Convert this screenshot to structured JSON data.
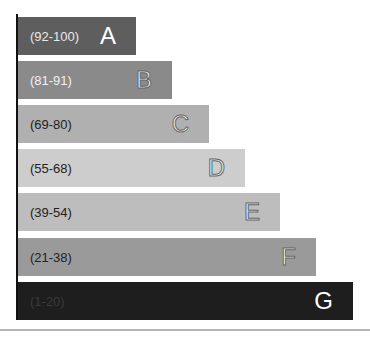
{
  "chart_data": {
    "type": "bar",
    "orientation": "horizontal",
    "title": "",
    "xlabel": "",
    "ylabel": "",
    "grid": false,
    "legend": null,
    "categories": [
      "A",
      "B",
      "C",
      "D",
      "E",
      "F",
      "G"
    ],
    "ranges": [
      "(92-100)",
      "(81-91)",
      "(69-80)",
      "(55-68)",
      "(39-54)",
      "(21-38)",
      "(1-20)"
    ],
    "values": [
      1,
      2,
      3,
      4,
      5,
      6,
      7
    ],
    "bars": [
      {
        "letter": "A",
        "range": "(92-100)",
        "top": 17,
        "width": 118,
        "color": "#5e5e5e",
        "range_color": "#e8e8e8",
        "letter_style": "solid"
      },
      {
        "letter": "B",
        "range": "(81-91)",
        "top": 61,
        "width": 154,
        "color": "#8a8a8a",
        "range_color": "#f0f0f0",
        "letter_style": "outline"
      },
      {
        "letter": "C",
        "range": "(69-80)",
        "top": 105,
        "width": 191,
        "color": "#b0b0b0",
        "range_color": "#222222",
        "letter_style": "outline"
      },
      {
        "letter": "D",
        "range": "(55-68)",
        "top": 149,
        "width": 227,
        "color": "#cdcdcd",
        "range_color": "#222222",
        "letter_style": "outline"
      },
      {
        "letter": "E",
        "range": "(39-54)",
        "top": 193,
        "width": 262,
        "color": "#bdbdbd",
        "range_color": "#222222",
        "letter_style": "outline"
      },
      {
        "letter": "F",
        "range": "(21-38)",
        "top": 238,
        "width": 298,
        "color": "#9a9a9a",
        "range_color": "#222222",
        "letter_style": "outline"
      },
      {
        "letter": "G",
        "range": "(1-20)",
        "top": 282,
        "width": 335,
        "color": "#1e1e1e",
        "range_color": "#3a3a3a",
        "letter_style": "solid"
      }
    ]
  }
}
